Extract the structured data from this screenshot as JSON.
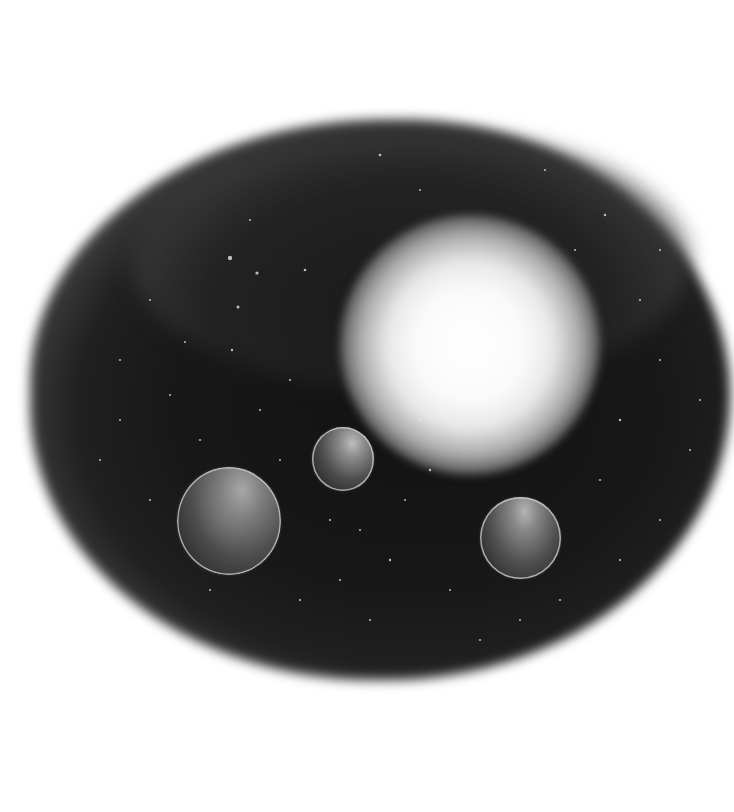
{
  "image": {
    "subject": "grayscale painting of a bright star with three planets inside a dark starry cloud",
    "background_color": "#ffffff",
    "cloud_color": "#161616",
    "star_glow_color": "#fafafa"
  },
  "elements": {
    "star": {
      "label": "bright star",
      "cx": 470,
      "cy": 345,
      "r": 130
    },
    "planets": [
      {
        "label": "large planet",
        "cx": 229,
        "cy": 521,
        "r": 53
      },
      {
        "label": "small planet",
        "cx": 343,
        "cy": 459,
        "r": 31
      },
      {
        "label": "right planet",
        "cx": 520,
        "cy": 538,
        "r": 41
      }
    ]
  }
}
